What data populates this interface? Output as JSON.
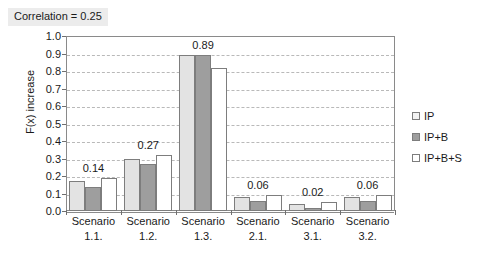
{
  "chart_data": {
    "type": "bar",
    "title": "Correlation = 0.25",
    "xlabel": "",
    "ylabel": "F(x) increase",
    "ylim": [
      0.0,
      1.0
    ],
    "ytick_step": 0.1,
    "grid": true,
    "legend_position": "right",
    "categories": [
      "Scenario 1.1.",
      "Scenario 1.2.",
      "Scenario 1.3.",
      "Scenario 2.1.",
      "Scenario 3.1.",
      "Scenario 3.2."
    ],
    "category_lines": [
      {
        "line1": "Scenario",
        "line2": "1.1."
      },
      {
        "line1": "Scenario",
        "line2": "1.2."
      },
      {
        "line1": "Scenario",
        "line2": "1.3."
      },
      {
        "line1": "Scenario",
        "line2": "2.1."
      },
      {
        "line1": "Scenario",
        "line2": "3.1."
      },
      {
        "line1": "Scenario",
        "line2": "3.2."
      }
    ],
    "series": [
      {
        "name": "IP",
        "color": "#e3e3e3",
        "values": [
          0.17,
          0.3,
          0.89,
          0.08,
          0.04,
          0.08
        ]
      },
      {
        "name": "IP+B",
        "color": "#9e9e9e",
        "values": [
          0.14,
          0.27,
          0.89,
          0.06,
          0.02,
          0.06
        ]
      },
      {
        "name": "IP+B+S",
        "color": "#ffffff",
        "values": [
          0.19,
          0.32,
          0.82,
          0.09,
          0.05,
          0.09
        ]
      }
    ],
    "data_labels": [
      "0.14",
      "0.27",
      "0.89",
      "0.06",
      "0.02",
      "0.06"
    ],
    "ytick_labels": [
      "1.0",
      "0.9",
      "0.8",
      "0.7",
      "0.6",
      "0.5",
      "0.4",
      "0.3",
      "0.2",
      "0.1",
      "0.0"
    ],
    "ytick_values": [
      1.0,
      0.9,
      0.8,
      0.7,
      0.6,
      0.5,
      0.4,
      0.3,
      0.2,
      0.1,
      0.0
    ]
  },
  "legend": {
    "items": [
      {
        "label": "IP"
      },
      {
        "label": "IP+B"
      },
      {
        "label": "IP+B+S"
      }
    ]
  }
}
